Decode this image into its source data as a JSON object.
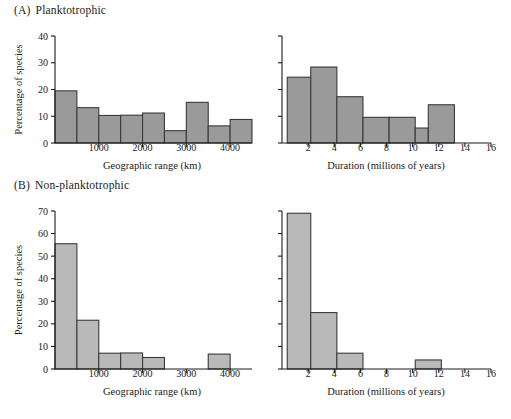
{
  "figure": {
    "background": "#ffffff",
    "bar_fill_a": "#9a9a9a",
    "bar_fill_b": "#b9b9b9",
    "bar_stroke": "#3a3a3a",
    "axis_color": "#1a1a1a"
  },
  "panels": [
    {
      "id": "A",
      "tag": "(A)",
      "title": "Planktotrophic",
      "charts": [
        "A1",
        "A2"
      ]
    },
    {
      "id": "B",
      "tag": "(B)",
      "title": "Non-planktotrophic",
      "charts": [
        "B1",
        "B2"
      ]
    }
  ],
  "chart_data": [
    {
      "id": "A1",
      "type": "bar",
      "title": "(A) Planktotrophic — Geographic range",
      "xlabel": "Geographic range (km)",
      "ylabel": "Percentage of species",
      "xlim": [
        0,
        4500
      ],
      "ylim": [
        0,
        40
      ],
      "yticks": [
        0,
        10,
        20,
        30,
        40
      ],
      "ytick_labels": [
        "0",
        "10",
        "20",
        "30",
        "40"
      ],
      "xticks": [
        1000,
        2000,
        3000,
        4000
      ],
      "xtick_labels": [
        "1000",
        "2000",
        "3000",
        "4000"
      ],
      "bin_edges": [
        0,
        500,
        1000,
        1500,
        2000,
        2500,
        3000,
        3500,
        4000,
        4500
      ],
      "values": [
        19.5,
        13.2,
        10.3,
        10.4,
        11.2,
        4.6,
        15.2,
        6.4,
        8.8
      ],
      "grid": false,
      "legend": null
    },
    {
      "id": "A2",
      "type": "bar",
      "title": "(A) Planktotrophic — Duration",
      "xlabel": "Duration (millions of years)",
      "ylabel": "",
      "xlim": [
        0,
        16
      ],
      "ylim": [
        0,
        40
      ],
      "yticks": [
        0,
        10,
        20,
        30,
        40
      ],
      "ytick_labels": [
        "",
        "",
        "",
        "",
        ""
      ],
      "xticks": [
        2,
        4,
        6,
        8,
        10,
        12,
        14,
        16
      ],
      "xtick_labels": [
        "2",
        "4",
        "6",
        "8",
        "10",
        "12",
        "14",
        "16"
      ],
      "bin_edges": [
        0.4,
        2.2,
        4.2,
        6.2,
        8.2,
        10.2,
        11.2,
        13.2
      ],
      "values": [
        24.6,
        28.4,
        17.3,
        9.6,
        9.6,
        5.6,
        14.3
      ],
      "grid": false,
      "legend": null
    },
    {
      "id": "B1",
      "type": "bar",
      "title": "(B) Non-planktotrophic — Geographic range",
      "xlabel": "Geographic range (km)",
      "ylabel": "Percentage of species",
      "xlim": [
        0,
        4500
      ],
      "ylim": [
        0,
        70
      ],
      "yticks": [
        0,
        10,
        20,
        30,
        40,
        50,
        60,
        70
      ],
      "ytick_labels": [
        "0",
        "10",
        "20",
        "30",
        "40",
        "50",
        "60",
        "70"
      ],
      "xticks": [
        1000,
        2000,
        3000,
        4000
      ],
      "xtick_labels": [
        "1000",
        "2000",
        "3000",
        "4000"
      ],
      "bin_edges": [
        0,
        500,
        1000,
        1500,
        2000,
        2500,
        3000,
        3500,
        4000,
        4500
      ],
      "values": [
        55.5,
        21.6,
        7.0,
        7.1,
        5.1,
        0,
        0,
        6.6,
        0
      ],
      "grid": false,
      "legend": null
    },
    {
      "id": "B2",
      "type": "bar",
      "title": "(B) Non-planktotrophic — Duration",
      "xlabel": "Duration (millions of years)",
      "ylabel": "",
      "xlim": [
        0,
        16
      ],
      "ylim": [
        0,
        70
      ],
      "yticks": [
        0,
        10,
        20,
        30,
        40,
        50,
        60,
        70
      ],
      "ytick_labels": [
        "",
        "",
        "",
        "",
        "",
        "",
        "",
        ""
      ],
      "xticks": [
        2,
        4,
        6,
        8,
        10,
        12,
        14,
        16
      ],
      "xtick_labels": [
        "2",
        "4",
        "6",
        "8",
        "10",
        "12",
        "14",
        "16"
      ],
      "bin_edges": [
        0.4,
        2.2,
        4.2,
        6.2,
        8.2,
        10.2,
        12.2
      ],
      "values": [
        69.0,
        25.0,
        7.0,
        0,
        0,
        4.0
      ],
      "grid": false,
      "legend": null
    }
  ]
}
